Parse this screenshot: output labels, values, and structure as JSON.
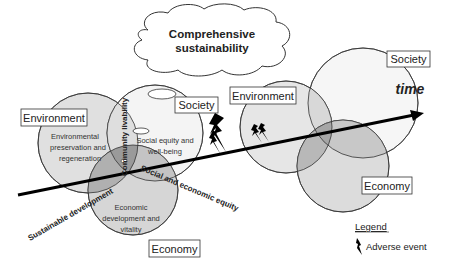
{
  "title": {
    "line1": "Comprehensive",
    "line2": "sustainability"
  },
  "left_cluster": {
    "environment": {
      "label": "Environment",
      "inner": [
        "Environmental",
        "preservation and",
        "regeneration"
      ]
    },
    "society": {
      "label": "Society",
      "inner": [
        "Social equity and",
        "well-being"
      ]
    },
    "economy": {
      "label": "Economy",
      "inner": [
        "Economic",
        "development and",
        "vitality"
      ]
    },
    "overlaps": {
      "env_society": "Community livability",
      "society_economy": "Social and economic equity",
      "env_economy": "Sustainable development"
    }
  },
  "right_cluster": {
    "environment": {
      "label": "Environment"
    },
    "society": {
      "label": "Society"
    },
    "economy": {
      "label": "Economy"
    }
  },
  "axis": {
    "label": "time"
  },
  "legend": {
    "title": "Legend",
    "item": "Adverse event",
    "icon": "lightning-bolt-icon"
  },
  "colors": {
    "circle_fill": "#d9d9d9",
    "overlap_fill": "#a8a8a8",
    "stroke": "#333333",
    "arrow": "#000000"
  }
}
